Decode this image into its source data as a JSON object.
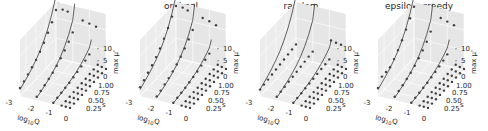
{
  "chart_data": [
    {
      "type": "scatter",
      "title": "ts",
      "xlabel": "log10Q",
      "ylabel": "s",
      "zlabel": "max μ'",
      "xlim": [
        -3,
        0
      ],
      "ylim": [
        0.1,
        1.0
      ],
      "zlim": [
        0,
        12
      ],
      "x_ticks": [
        "-3",
        "-2",
        "-1",
        "0"
      ],
      "y_ticks": [
        "0.25",
        "0.50",
        "0.75",
        "1.00"
      ],
      "z_ticks": [
        "0",
        "5",
        "10"
      ],
      "grid": true,
      "series": [
        {
          "name": "log10Q=-3",
          "x": -3,
          "s": [
            0.1,
            0.2,
            0.3,
            0.4,
            0.5,
            0.6,
            0.7,
            0.8,
            0.9,
            1.0
          ],
          "points": [
            2.0,
            2.6,
            3.3,
            4.0,
            4.8,
            5.8,
            7.0,
            8.4,
            10.0,
            12.0
          ],
          "fit": [
            1.6,
            2.3,
            3.0,
            3.8,
            4.8,
            6.0,
            7.6,
            9.6,
            12.2,
            15.5
          ]
        },
        {
          "name": "log10Q=-2",
          "x": -2,
          "s": [
            0.1,
            0.2,
            0.3,
            0.4,
            0.5,
            0.6,
            0.7,
            0.8,
            0.9,
            1.0
          ],
          "points": [
            0.8,
            1.2,
            1.6,
            2.1,
            2.6,
            3.3,
            4.1,
            5.0,
            6.1,
            7.4
          ],
          "fit": [
            0.6,
            1.0,
            1.5,
            2.0,
            2.7,
            3.5,
            4.6,
            6.0,
            7.9,
            10.4
          ]
        },
        {
          "name": "log10Q=-1",
          "x": -1,
          "s": [
            0.1,
            0.2,
            0.3,
            0.4,
            0.5,
            0.6,
            0.7,
            0.8,
            0.9,
            1.0
          ],
          "points": [
            0.3,
            0.5,
            0.7,
            0.9,
            1.1,
            1.4,
            1.7,
            2.0,
            2.4,
            2.9
          ],
          "fit": [
            0.2,
            0.4,
            0.6,
            0.9,
            1.2,
            1.6,
            2.1,
            2.7,
            3.5,
            4.5
          ]
        },
        {
          "name": "log10Q=-0.5",
          "x": -0.5,
          "s": [
            0.1,
            0.2,
            0.3,
            0.4,
            0.5,
            0.6,
            0.7,
            0.8,
            0.9,
            1.0
          ],
          "points": [
            0.1,
            0.15,
            0.2,
            0.3,
            0.35,
            0.4,
            0.5,
            0.6,
            0.7,
            0.8
          ],
          "fit": null
        },
        {
          "name": "log10Q=-0.25",
          "x": -0.25,
          "s": [
            0.1,
            0.2,
            0.3,
            0.4,
            0.5,
            0.6,
            0.7,
            0.8,
            0.9,
            1.0
          ],
          "points": [
            0.05,
            0.1,
            0.15,
            0.2,
            0.25,
            0.3,
            0.35,
            0.4,
            0.45,
            0.5
          ],
          "fit": null
        },
        {
          "name": "log10Q=0",
          "x": 0,
          "s": [
            0.1,
            0.2,
            0.3,
            0.4,
            0.5,
            0.6,
            0.7,
            0.8,
            0.9,
            1.0
          ],
          "points": [
            0.02,
            0.05,
            0.08,
            0.1,
            0.12,
            0.15,
            0.18,
            0.2,
            0.22,
            0.25
          ],
          "fit": null
        },
        {
          "name": "outliers",
          "x": null,
          "s": null,
          "points_xyz": [
            [
              -2.6,
              1.0,
              12.5
            ],
            [
              -2.3,
              1.0,
              12.3
            ],
            [
              -1.4,
              1.0,
              11.0
            ],
            [
              -1.0,
              1.0,
              10.6
            ],
            [
              -0.6,
              1.0,
              10.2
            ]
          ],
          "fit": null
        }
      ]
    },
    {
      "type": "scatter",
      "title": "optimal",
      "xlabel": "log10Q",
      "ylabel": "s",
      "zlabel": "max μ'",
      "xlim": [
        -3,
        0
      ],
      "ylim": [
        0.1,
        1.0
      ],
      "zlim": [
        0,
        12
      ],
      "x_ticks": [
        "-3",
        "-2",
        "-1",
        "0"
      ],
      "y_ticks": [
        "0.25",
        "0.50",
        "0.75",
        "1.00"
      ],
      "z_ticks": [
        "0",
        "5",
        "10"
      ],
      "grid": true,
      "series": [
        {
          "name": "log10Q=-3",
          "x": -3,
          "s": [
            0.1,
            0.2,
            0.3,
            0.4,
            0.5,
            0.6,
            0.7,
            0.8,
            0.9,
            1.0
          ],
          "points": [
            2.2,
            2.9,
            3.7,
            4.5,
            5.5,
            6.6,
            8.0,
            9.6,
            11.4,
            13.0
          ],
          "fit": [
            1.6,
            2.3,
            3.0,
            3.8,
            4.8,
            6.0,
            7.6,
            9.6,
            12.2,
            15.5
          ]
        },
        {
          "name": "log10Q=-2",
          "x": -2,
          "s": [
            0.1,
            0.2,
            0.3,
            0.4,
            0.5,
            0.6,
            0.7,
            0.8,
            0.9,
            1.0
          ],
          "points": [
            0.9,
            1.3,
            1.8,
            2.3,
            2.9,
            3.6,
            4.5,
            5.5,
            6.7,
            8.0
          ],
          "fit": [
            0.6,
            1.0,
            1.5,
            2.0,
            2.7,
            3.5,
            4.6,
            6.0,
            7.9,
            10.4
          ]
        },
        {
          "name": "log10Q=-1",
          "x": -1,
          "s": [
            0.1,
            0.2,
            0.3,
            0.4,
            0.5,
            0.6,
            0.7,
            0.8,
            0.9,
            1.0
          ],
          "points": [
            0.3,
            0.5,
            0.7,
            0.9,
            1.2,
            1.5,
            1.8,
            2.2,
            2.6,
            3.1
          ],
          "fit": [
            0.2,
            0.4,
            0.6,
            0.9,
            1.2,
            1.6,
            2.1,
            2.7,
            3.5,
            4.5
          ]
        },
        {
          "name": "log10Q=-0.5",
          "x": -0.5,
          "s": [
            0.1,
            0.2,
            0.3,
            0.4,
            0.5,
            0.6,
            0.7,
            0.8,
            0.9,
            1.0
          ],
          "points": [
            0.1,
            0.15,
            0.2,
            0.3,
            0.35,
            0.4,
            0.5,
            0.6,
            0.7,
            0.8
          ],
          "fit": null
        },
        {
          "name": "log10Q=-0.25",
          "x": -0.25,
          "s": [
            0.1,
            0.2,
            0.3,
            0.4,
            0.5,
            0.6,
            0.7,
            0.8,
            0.9,
            1.0
          ],
          "points": [
            0.05,
            0.1,
            0.15,
            0.2,
            0.25,
            0.3,
            0.35,
            0.4,
            0.45,
            0.5
          ],
          "fit": null
        },
        {
          "name": "log10Q=0",
          "x": 0,
          "s": [
            0.1,
            0.2,
            0.3,
            0.4,
            0.5,
            0.6,
            0.7,
            0.8,
            0.9,
            1.0
          ],
          "points": [
            0.02,
            0.05,
            0.08,
            0.1,
            0.12,
            0.15,
            0.18,
            0.2,
            0.22,
            0.25
          ],
          "fit": null
        },
        {
          "name": "outliers",
          "x": null,
          "s": null,
          "points_xyz": [
            [
              -2.6,
              1.0,
              13.0
            ],
            [
              -2.3,
              1.0,
              12.6
            ],
            [
              -1.4,
              1.0,
              11.6
            ],
            [
              -1.0,
              1.0,
              11.2
            ],
            [
              -0.6,
              1.0,
              10.6
            ]
          ],
          "fit": null
        }
      ]
    },
    {
      "type": "scatter",
      "title": "random",
      "xlabel": "log10Q",
      "ylabel": "s",
      "zlabel": "max μ'",
      "xlim": [
        -3,
        0
      ],
      "ylim": [
        0.1,
        1.0
      ],
      "zlim": [
        0,
        12
      ],
      "x_ticks": [
        "-3",
        "-2",
        "-1",
        "0"
      ],
      "y_ticks": [
        "0.25",
        "0.50",
        "0.75",
        "1.00"
      ],
      "z_ticks": [
        "0",
        "5",
        "10"
      ],
      "grid": true,
      "series": [
        {
          "name": "log10Q=-3",
          "x": -3,
          "s": [
            0.1,
            0.2,
            0.3,
            0.4,
            0.5,
            0.6,
            0.7,
            0.8,
            0.9,
            1.0
          ],
          "points": [
            1.6,
            1.8,
            2.0,
            2.2,
            2.4,
            2.6,
            2.8,
            3.0,
            3.2,
            3.4
          ],
          "fit": [
            1.6,
            2.3,
            3.0,
            3.8,
            4.8,
            6.0,
            7.6,
            9.6,
            12.2,
            15.5
          ]
        },
        {
          "name": "log10Q=-2",
          "x": -2,
          "s": [
            0.1,
            0.2,
            0.3,
            0.4,
            0.5,
            0.6,
            0.7,
            0.8,
            0.9,
            1.0
          ],
          "points": [
            0.8,
            1.0,
            1.2,
            1.4,
            1.6,
            1.8,
            2.0,
            2.2,
            2.4,
            2.6
          ],
          "fit": [
            0.6,
            1.0,
            1.5,
            2.0,
            2.7,
            3.5,
            4.6,
            6.0,
            7.9,
            10.4
          ]
        },
        {
          "name": "log10Q=-1",
          "x": -1,
          "s": [
            0.1,
            0.2,
            0.3,
            0.4,
            0.5,
            0.6,
            0.7,
            0.8,
            0.9,
            1.0
          ],
          "points": [
            0.3,
            0.45,
            0.6,
            0.75,
            0.9,
            1.05,
            1.2,
            1.35,
            1.5,
            1.65
          ],
          "fit": [
            0.2,
            0.4,
            0.6,
            0.9,
            1.2,
            1.6,
            2.1,
            2.7,
            3.5,
            4.5
          ]
        },
        {
          "name": "log10Q=-0.5",
          "x": -0.5,
          "s": [
            0.1,
            0.2,
            0.3,
            0.4,
            0.5,
            0.6,
            0.7,
            0.8,
            0.9,
            1.0
          ],
          "points": [
            0.1,
            0.15,
            0.2,
            0.3,
            0.35,
            0.4,
            0.5,
            0.6,
            0.7,
            0.8
          ],
          "fit": null
        },
        {
          "name": "log10Q=-0.25",
          "x": -0.25,
          "s": [
            0.1,
            0.2,
            0.3,
            0.4,
            0.5,
            0.6,
            0.7,
            0.8,
            0.9,
            1.0
          ],
          "points": [
            0.05,
            0.1,
            0.15,
            0.2,
            0.25,
            0.3,
            0.35,
            0.4,
            0.45,
            0.5
          ],
          "fit": null
        },
        {
          "name": "log10Q=0",
          "x": 0,
          "s": [
            0.1,
            0.2,
            0.3,
            0.4,
            0.5,
            0.6,
            0.7,
            0.8,
            0.9,
            1.0
          ],
          "points": [
            0.02,
            0.05,
            0.08,
            0.1,
            0.12,
            0.15,
            0.18,
            0.2,
            0.22,
            0.25
          ],
          "fit": null
        },
        {
          "name": "outliers",
          "x": null,
          "s": null,
          "points_xyz": [
            [
              -0.9,
              1.0,
              6.5
            ],
            [
              -0.6,
              1.0,
              6.2
            ],
            [
              -0.3,
              1.0,
              6.0
            ]
          ],
          "fit": null
        }
      ]
    },
    {
      "type": "scatter",
      "title": "epsilon_greedy",
      "xlabel": "log10Q",
      "ylabel": "s",
      "zlabel": "max μ'",
      "xlim": [
        -3,
        0
      ],
      "ylim": [
        0.1,
        1.0
      ],
      "zlim": [
        0,
        12
      ],
      "x_ticks": [
        "-3",
        "-2",
        "-1",
        "0"
      ],
      "y_ticks": [
        "0.25",
        "0.50",
        "0.75",
        "1.00"
      ],
      "z_ticks": [
        "0",
        "5",
        "10"
      ],
      "grid": true,
      "series": [
        {
          "name": "log10Q=-3",
          "x": -3,
          "s": [
            0.1,
            0.2,
            0.3,
            0.4,
            0.5,
            0.6,
            0.7,
            0.8,
            0.9,
            1.0
          ],
          "points": [
            2.0,
            3.8,
            3.9,
            4.0,
            5.0,
            6.2,
            7.6,
            9.2,
            11.0,
            12.8
          ],
          "fit": [
            1.6,
            2.3,
            3.0,
            3.8,
            4.8,
            6.0,
            7.6,
            9.6,
            12.2,
            15.5
          ]
        },
        {
          "name": "log10Q=-2",
          "x": -2,
          "s": [
            0.1,
            0.2,
            0.3,
            0.4,
            0.5,
            0.6,
            0.7,
            0.8,
            0.9,
            1.0
          ],
          "points": [
            0.8,
            1.2,
            1.6,
            2.1,
            2.6,
            3.3,
            4.1,
            5.0,
            6.1,
            7.6
          ],
          "fit": [
            0.6,
            1.0,
            1.5,
            2.0,
            2.7,
            3.5,
            4.6,
            6.0,
            7.9,
            10.4
          ]
        },
        {
          "name": "log10Q=-1",
          "x": -1,
          "s": [
            0.1,
            0.2,
            0.3,
            0.4,
            0.5,
            0.6,
            0.7,
            0.8,
            0.9,
            1.0
          ],
          "points": [
            0.3,
            0.5,
            0.7,
            0.9,
            1.1,
            1.4,
            1.7,
            2.0,
            2.4,
            2.9
          ],
          "fit": [
            0.2,
            0.4,
            0.6,
            0.9,
            1.2,
            1.6,
            2.1,
            2.7,
            3.5,
            4.5
          ]
        },
        {
          "name": "log10Q=-0.5",
          "x": -0.5,
          "s": [
            0.1,
            0.2,
            0.3,
            0.4,
            0.5,
            0.6,
            0.7,
            0.8,
            0.9,
            1.0
          ],
          "points": [
            0.1,
            0.15,
            0.2,
            0.3,
            0.35,
            0.4,
            0.5,
            0.6,
            0.7,
            0.8
          ],
          "fit": null
        },
        {
          "name": "log10Q=-0.25",
          "x": -0.25,
          "s": [
            0.1,
            0.2,
            0.3,
            0.4,
            0.5,
            0.6,
            0.7,
            0.8,
            0.9,
            1.0
          ],
          "points": [
            0.05,
            0.1,
            0.15,
            0.2,
            0.25,
            0.3,
            0.35,
            0.4,
            0.45,
            0.5
          ],
          "fit": null
        },
        {
          "name": "log10Q=0",
          "x": 0,
          "s": [
            0.1,
            0.2,
            0.3,
            0.4,
            0.5,
            0.6,
            0.7,
            0.8,
            0.9,
            1.0
          ],
          "points": [
            0.02,
            0.05,
            0.08,
            0.1,
            0.12,
            0.15,
            0.18,
            0.2,
            0.22,
            0.25
          ],
          "fit": null
        },
        {
          "name": "outliers",
          "x": null,
          "s": null,
          "points_xyz": [
            [
              -1.4,
              1.0,
              11.6
            ],
            [
              -1.0,
              1.0,
              11.1
            ],
            [
              -0.6,
              1.0,
              10.6
            ]
          ],
          "fit": null
        }
      ]
    }
  ]
}
